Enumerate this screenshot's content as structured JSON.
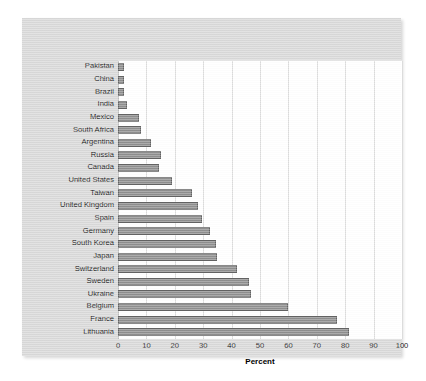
{
  "chart_data": {
    "type": "bar",
    "orientation": "horizontal",
    "title": "",
    "xlabel": "Percent",
    "ylabel": "",
    "xlim": [
      0,
      100
    ],
    "xticks": [
      0,
      10,
      20,
      30,
      40,
      50,
      60,
      70,
      80,
      90,
      100
    ],
    "grid": true,
    "legend": "none",
    "categories": [
      "Pakistan",
      "China",
      "Brazil",
      "India",
      "Mexico",
      "South Africa",
      "Argentina",
      "Russia",
      "Canada",
      "United States",
      "Taiwan",
      "United Kingdom",
      "Spain",
      "Germany",
      "South Korea",
      "Japan",
      "Switzerland",
      "Sweden",
      "Ukraine",
      "Belgium",
      "France",
      "Lithuania"
    ],
    "values": [
      2,
      2,
      2,
      3,
      7.5,
      8,
      11.5,
      15,
      14.5,
      19,
      26,
      28,
      29.5,
      32.5,
      34.5,
      35,
      42,
      46,
      47,
      60,
      77,
      81.5
    ]
  },
  "style": {
    "bar_fill": "#8f8f8f",
    "bar_border": "#636363",
    "panel_background": "#d9d9d9",
    "plot_background": "#ffffff",
    "gridline_color": "#dcdcdc",
    "text_color": "#1a1a1a"
  }
}
